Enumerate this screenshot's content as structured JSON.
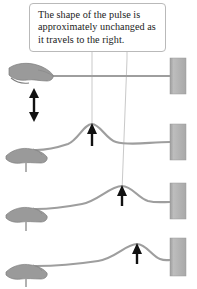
{
  "figure": {
    "kind": "physics-illustration",
    "width": 197,
    "height": 289,
    "background_color": "#ffffff"
  },
  "callout": {
    "text": "The shape of the pulse is approximately unchanged as it travels to the right.",
    "border_color": "#b9b9b9",
    "background_color": "#ffffff",
    "text_color": "#1b1b1b",
    "leader_line_color": "#c9c9c9"
  },
  "colors": {
    "rope": "#9e9e9e",
    "hand": "#9a9a9a",
    "hand_outline": "#7d7d7d",
    "wall_anchor": "#b0b0b0",
    "wall_anchor_edge": "#9a9a9a",
    "arrow": "#111111"
  },
  "leader_lines": [
    {
      "name": "leader-to-panel-2",
      "from_x": 92,
      "to_x": 92,
      "target_row": 2
    },
    {
      "name": "leader-to-panel-3",
      "from_x": 127,
      "to_x": 122,
      "target_row": 3
    }
  ],
  "panels": [
    {
      "index": 1,
      "label": "panel-1-flat-rope",
      "baseline_y": 76,
      "pulse_peak_x": null,
      "pulse_height": 0,
      "description": "Rope held straight; hand about to flick it up and down.",
      "has_hand": true,
      "has_double_arrow": true,
      "has_peak_arrow": false,
      "wall_anchor": {
        "x": 170,
        "y": 58,
        "width": 16,
        "height": 36
      }
    },
    {
      "index": 2,
      "label": "panel-2-pulse-near-hand",
      "baseline_y": 142,
      "pulse_peak_x": 92,
      "pulse_height": 19,
      "description": "Pulse has formed and moved a short way to the right.",
      "has_hand": true,
      "has_double_arrow": false,
      "has_peak_arrow": true,
      "wall_anchor": {
        "x": 170,
        "y": 124,
        "width": 16,
        "height": 36
      }
    },
    {
      "index": 3,
      "label": "panel-3-pulse-midway",
      "baseline_y": 201,
      "pulse_peak_x": 122,
      "pulse_height": 17,
      "description": "Pulse has traveled farther right, same shape.",
      "has_hand": true,
      "has_double_arrow": false,
      "has_peak_arrow": true,
      "wall_anchor": {
        "x": 170,
        "y": 183,
        "width": 16,
        "height": 36
      }
    },
    {
      "index": 4,
      "label": "panel-4-pulse-near-wall",
      "baseline_y": 258,
      "pulse_peak_x": 137,
      "pulse_height": 16,
      "description": "Pulse approaches the fixed end at the wall.",
      "has_hand": true,
      "has_double_arrow": false,
      "has_peak_arrow": true,
      "wall_anchor": {
        "x": 170,
        "y": 238,
        "width": 16,
        "height": 38
      }
    }
  ],
  "annotations": {
    "double_arrow": {
      "name": "hand-motion-double-arrow",
      "meaning": "hand moves up and down",
      "x": 34,
      "top_y": 90,
      "bottom_y": 120
    },
    "peak_arrows": [
      {
        "name": "peak-arrow-panel-2",
        "x": 92,
        "tip_y": 124,
        "tail_y": 146
      },
      {
        "name": "peak-arrow-panel-3",
        "x": 122,
        "tip_y": 186,
        "tail_y": 206
      },
      {
        "name": "peak-arrow-panel-4",
        "x": 137,
        "tip_y": 244,
        "tail_y": 264
      }
    ]
  }
}
